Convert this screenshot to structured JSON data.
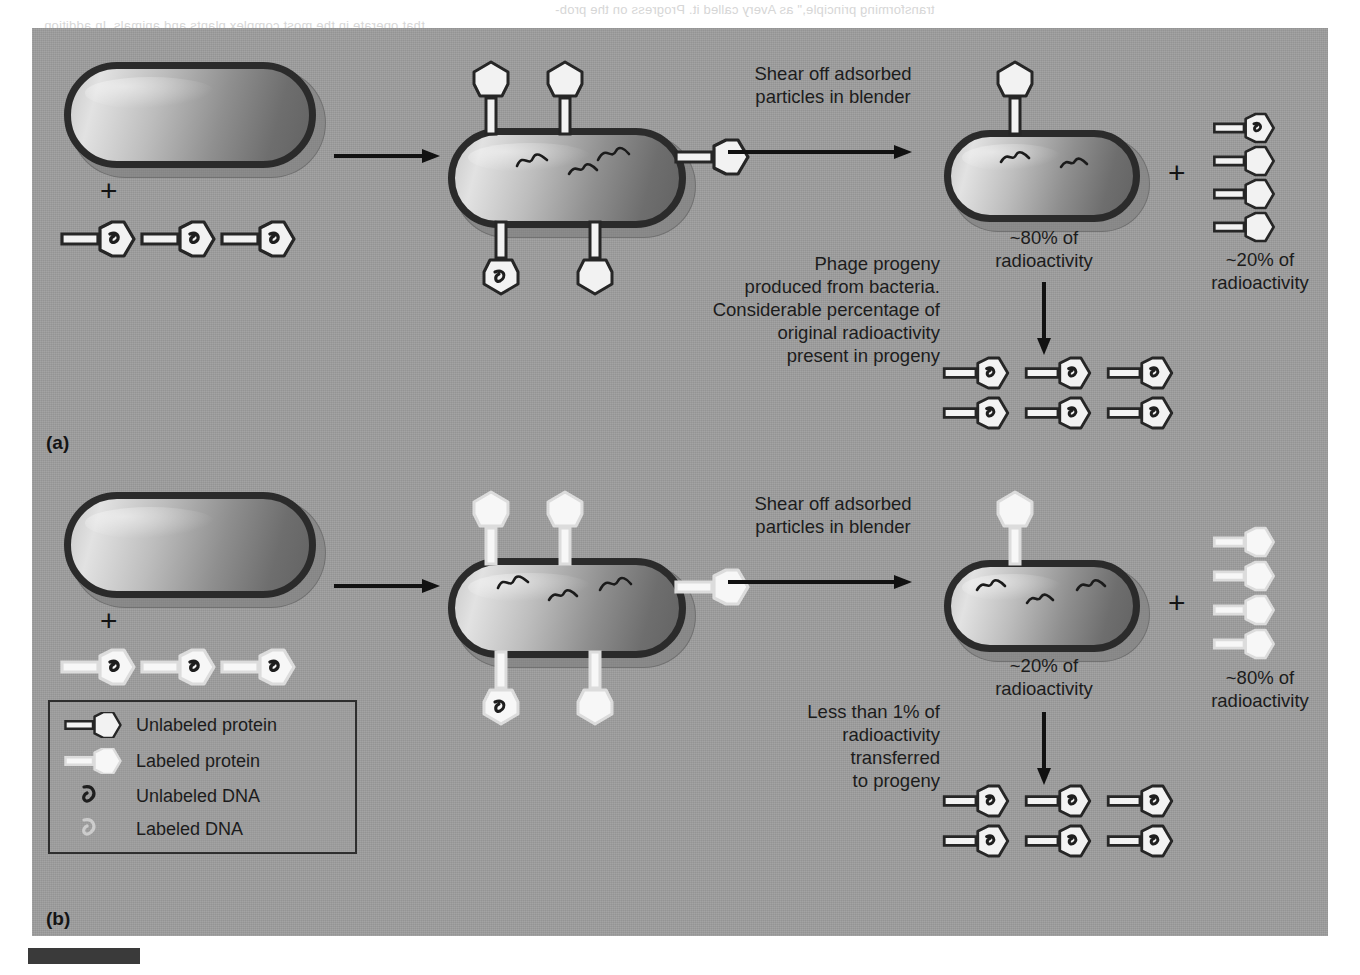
{
  "figure": {
    "panel_a_letter": "(a)",
    "panel_b_letter": "(b)",
    "background_color": "#9e9e9e",
    "page_color": "#ffffff",
    "ink_color": "#1c1c1c"
  },
  "ghost_text": {
    "line1": "transforming principle,\" as Avery called it. Progress on the prob-",
    "line2": "that operate in the most complex plants and animals. In addition"
  },
  "panel_a": {
    "letter": "(a)",
    "plus_sign": "+",
    "shear_label": "Shear off adsorbed\nparticles in blender",
    "progeny_label": "Phage progeny\nproduced from bacteria.\nConsiderable percentage of\noriginal radioactivity\npresent in progeny",
    "bacteria_radioactivity": "~80% of\nradioactivity",
    "phage_radioactivity": "~20% of\nradioactivity",
    "input_phage_count": 3,
    "input_phage_type": "unlabeled-protein-labeled-dna",
    "adsorbed_phage_count": 5,
    "sheared_phage_count": 4,
    "progeny_phage_count": 6,
    "progeny_phage_type": "labeled-dna"
  },
  "panel_b": {
    "letter": "(b)",
    "plus_sign": "+",
    "shear_label": "Shear off adsorbed\nparticles in blender",
    "progeny_label": "Less than 1% of\nradioactivity\ntransferred\nto progeny",
    "bacteria_radioactivity": "~20% of\nradioactivity",
    "phage_radioactivity": "~80% of\nradioactivity",
    "input_phage_count": 3,
    "input_phage_type": "labeled-protein-unlabeled-dna",
    "adsorbed_phage_count": 5,
    "sheared_phage_count": 4,
    "progeny_phage_count": 6,
    "progeny_phage_type": "unlabeled-dna"
  },
  "legend": {
    "items": [
      {
        "swatch": "unlabeled-protein-phage-icon",
        "label": "Unlabeled protein"
      },
      {
        "swatch": "labeled-protein-phage-icon",
        "label": "Labeled protein"
      },
      {
        "swatch": "unlabeled-dna-icon",
        "label": "Unlabeled DNA"
      },
      {
        "swatch": "labeled-dna-icon",
        "label": "Labeled DNA"
      }
    ]
  },
  "colors": {
    "panel_bg": "#9e9e9e",
    "dark_ink": "#2b2b2b",
    "phage_fill": "#f2f2f2",
    "phage_dark_outline": "#262626",
    "phage_light_outline": "#d2d2d2",
    "dna_dark": "#1e1e1e",
    "dna_light": "#e8e8e8",
    "bacterium_outline": "#2b2b2b"
  }
}
